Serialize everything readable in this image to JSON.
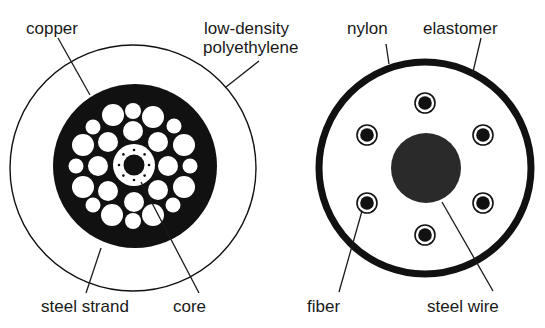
{
  "figure": {
    "left_cable": {
      "name": "copper-cored submarine cable cross-section",
      "labels": {
        "copper": "copper",
        "ldpe_line1": "low-density",
        "ldpe_line2": "polyethylene",
        "steel_strand": "steel strand",
        "core": "core"
      }
    },
    "right_cable": {
      "name": "fiber-optic cable cross-section",
      "labels": {
        "nylon": "nylon",
        "elastomer": "elastomer",
        "fiber": "fiber",
        "steel_wire": "steel wire"
      }
    }
  },
  "colors": {
    "ink": "#111111",
    "paper": "#ffffff",
    "steel_wire": "#2a2a2a"
  }
}
